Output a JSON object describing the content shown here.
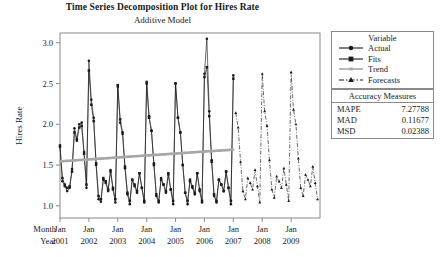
{
  "title": "Time Series Decomposition Plot for Hires Rate",
  "subtitle": "Additive Model",
  "legend": {
    "header": "Variable",
    "items": [
      {
        "label": "Actual",
        "marker": "circle",
        "line": "solid",
        "color": "#1a1a1a"
      },
      {
        "label": "Fits",
        "marker": "square",
        "line": "solid",
        "color": "#1a1a1a"
      },
      {
        "label": "Trend",
        "marker": "star",
        "line": "solid",
        "color": "#a8a8a8"
      },
      {
        "label": "Forecasts",
        "marker": "triangle",
        "line": "dashdot",
        "color": "#1a1a1a"
      }
    ]
  },
  "accuracy": {
    "header": "Accuracy Measures",
    "rows": [
      {
        "name": "MAPE",
        "value": "7.27788"
      },
      {
        "name": "MAD",
        "value": "0.11677"
      },
      {
        "name": "MSD",
        "value": "0.02388"
      }
    ]
  },
  "axis_labels": {
    "month_label": "Month",
    "year_label": "Year",
    "months": [
      "Jan",
      "Jan",
      "Jan",
      "Jan",
      "Jan",
      "Jan",
      "Jan",
      "Jan",
      "Jan"
    ],
    "years": [
      "2001",
      "2002",
      "2003",
      "2004",
      "2005",
      "2006",
      "2007",
      "2008",
      "2009"
    ]
  },
  "chart_data": {
    "type": "line",
    "title": "Time Series Decomposition Plot for Hires Rate",
    "subtitle": "Additive Model",
    "xlabel": "",
    "ylabel": "Hires Rate",
    "ylim": [
      0.85,
      3.12
    ],
    "yticks": [
      1.0,
      1.5,
      2.0,
      2.5,
      3.0
    ],
    "ytick_labels": [
      "1.0",
      "1.5",
      "2.0",
      "2.5",
      "3.0"
    ],
    "grid": false,
    "legend_position": "right-outside",
    "x_tick_indices": [
      0,
      12,
      24,
      36,
      48,
      60,
      72,
      84,
      96
    ],
    "x_tick_labels": [
      "Jan 2001",
      "Jan 2002",
      "Jan 2003",
      "Jan 2004",
      "Jan 2005",
      "Jan 2006",
      "Jan 2007",
      "Jan 2008",
      "Jan 2009"
    ],
    "n_actual": 73,
    "n_total": 109,
    "series": [
      {
        "name": "Actual",
        "marker": "circle",
        "line": "solid",
        "color": "#1a1a1a",
        "start_index": 0,
        "values": [
          1.72,
          1.3,
          1.24,
          1.18,
          1.22,
          1.45,
          1.95,
          1.82,
          2.0,
          2.02,
          1.66,
          1.22,
          2.78,
          2.3,
          2.08,
          1.5,
          1.08,
          1.05,
          1.32,
          1.28,
          1.18,
          1.44,
          1.2,
          1.04,
          2.46,
          2.02,
          1.88,
          1.46,
          1.14,
          1.02,
          1.32,
          1.24,
          1.16,
          1.4,
          1.22,
          1.04,
          2.52,
          2.1,
          1.92,
          1.52,
          1.12,
          1.04,
          1.34,
          1.26,
          1.16,
          1.38,
          1.2,
          1.02,
          2.5,
          2.08,
          1.9,
          1.5,
          1.16,
          1.02,
          1.3,
          1.22,
          1.14,
          1.4,
          1.18,
          1.04,
          2.62,
          3.05,
          2.16,
          1.56,
          1.12,
          1.04,
          1.32,
          1.26,
          1.18,
          1.42,
          1.22,
          1.02,
          2.6
        ]
      },
      {
        "name": "Fits",
        "marker": "square",
        "line": "solid",
        "color": "#1a1a1a",
        "start_index": 0,
        "values": [
          1.74,
          1.34,
          1.26,
          1.22,
          1.24,
          1.42,
          1.9,
          1.8,
          1.96,
          1.98,
          1.64,
          1.26,
          2.66,
          2.24,
          2.04,
          1.52,
          1.12,
          1.08,
          1.34,
          1.3,
          1.2,
          1.42,
          1.22,
          1.08,
          2.48,
          2.06,
          1.9,
          1.48,
          1.16,
          1.06,
          1.32,
          1.26,
          1.18,
          1.4,
          1.22,
          1.06,
          2.5,
          2.08,
          1.92,
          1.5,
          1.14,
          1.06,
          1.32,
          1.26,
          1.18,
          1.4,
          1.2,
          1.06,
          2.5,
          2.08,
          1.9,
          1.5,
          1.16,
          1.06,
          1.32,
          1.24,
          1.16,
          1.4,
          1.2,
          1.06,
          2.58,
          2.7,
          2.1,
          1.54,
          1.14,
          1.06,
          1.32,
          1.26,
          1.18,
          1.42,
          1.22,
          1.06,
          2.56
        ]
      },
      {
        "name": "Trend",
        "marker": "star",
        "line": "solid",
        "color": "#a8a8a8",
        "start_index": 0,
        "values": [
          1.545,
          1.547,
          1.549,
          1.551,
          1.553,
          1.555,
          1.557,
          1.559,
          1.561,
          1.563,
          1.565,
          1.567,
          1.569,
          1.571,
          1.573,
          1.575,
          1.577,
          1.579,
          1.581,
          1.583,
          1.585,
          1.587,
          1.589,
          1.591,
          1.593,
          1.595,
          1.597,
          1.599,
          1.601,
          1.603,
          1.605,
          1.607,
          1.609,
          1.611,
          1.613,
          1.615,
          1.617,
          1.619,
          1.621,
          1.623,
          1.625,
          1.627,
          1.629,
          1.631,
          1.633,
          1.635,
          1.637,
          1.639,
          1.641,
          1.643,
          1.645,
          1.647,
          1.649,
          1.651,
          1.653,
          1.655,
          1.657,
          1.659,
          1.661,
          1.663,
          1.665,
          1.667,
          1.669,
          1.671,
          1.673,
          1.675,
          1.677,
          1.679,
          1.681,
          1.683,
          1.685,
          1.687,
          1.689
        ]
      },
      {
        "name": "Forecasts",
        "marker": "triangle",
        "line": "dashdot",
        "color": "#1a1a1a",
        "start_index": 73,
        "values": [
          2.14,
          1.96,
          1.54,
          1.18,
          1.08,
          1.34,
          1.28,
          1.2,
          1.44,
          1.24,
          1.04,
          2.62,
          2.16,
          1.98,
          1.56,
          1.2,
          1.1,
          1.36,
          1.3,
          1.22,
          1.46,
          1.26,
          1.06,
          2.64,
          2.18,
          2.0,
          1.58,
          1.22,
          1.12,
          1.38,
          1.32,
          1.24,
          1.48,
          1.28,
          1.08
        ]
      }
    ]
  }
}
